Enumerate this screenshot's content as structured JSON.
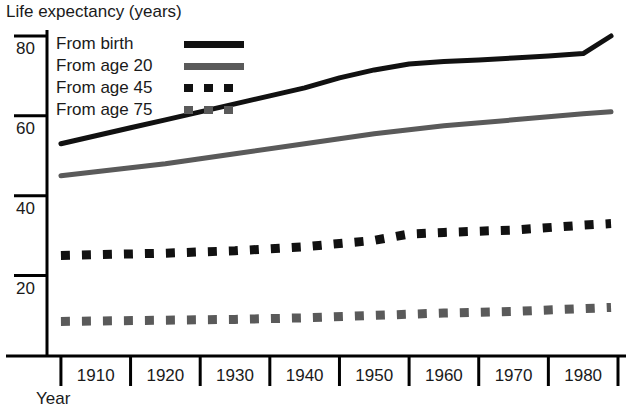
{
  "chart_data": {
    "type": "line",
    "title": "",
    "ylabel": "Life expectancy (years)",
    "xlabel": "Year",
    "xlim": [
      1903,
      1985
    ],
    "ylim": [
      0,
      88
    ],
    "yticks": [
      20,
      40,
      60,
      80
    ],
    "ytick_labels": [
      "20",
      "40",
      "60",
      "80"
    ],
    "xticks": [
      1910,
      1920,
      1930,
      1940,
      1950,
      1960,
      1970,
      1980
    ],
    "xtick_labels": [
      "1910",
      "1920",
      "1930",
      "1940",
      "1950",
      "1960",
      "1970",
      "1980"
    ],
    "grid": false,
    "legend_position": "upper left",
    "series": [
      {
        "name": "From birth",
        "style": "solid",
        "color": "#111111",
        "x": [
          1905,
          1910,
          1915,
          1920,
          1925,
          1930,
          1935,
          1940,
          1945,
          1950,
          1955,
          1960,
          1965,
          1970,
          1975,
          1980,
          1984
        ],
        "values": [
          53.0,
          55.0,
          57.0,
          59.0,
          61.0,
          63.0,
          65.0,
          67.0,
          69.5,
          71.5,
          73.0,
          73.6,
          74.0,
          74.5,
          75.0,
          75.6,
          80.0
        ]
      },
      {
        "name": "From age 20",
        "style": "solid",
        "color": "#5a5a5a",
        "x": [
          1905,
          1910,
          1920,
          1930,
          1940,
          1950,
          1960,
          1970,
          1980,
          1984
        ],
        "values": [
          45.0,
          46.0,
          48.0,
          50.5,
          53.0,
          55.5,
          57.5,
          59.0,
          60.5,
          61.0
        ]
      },
      {
        "name": "From age 45",
        "style": "dashed",
        "color": "#111111",
        "x": [
          1905,
          1910,
          1920,
          1930,
          1940,
          1950,
          1955,
          1960,
          1970,
          1980,
          1984
        ],
        "values": [
          25.0,
          25.2,
          25.6,
          26.2,
          27.2,
          28.8,
          30.4,
          30.8,
          31.4,
          32.6,
          33.0
        ]
      },
      {
        "name": "From age 75",
        "style": "dashed",
        "color": "#5a5a5a",
        "x": [
          1905,
          1910,
          1920,
          1930,
          1940,
          1950,
          1960,
          1970,
          1980,
          1984
        ],
        "values": [
          8.5,
          8.6,
          8.8,
          9.0,
          9.4,
          10.0,
          10.6,
          11.0,
          11.7,
          12.0
        ]
      }
    ]
  },
  "legend": {
    "items": [
      {
        "label": "From birth"
      },
      {
        "label": "From age 20"
      },
      {
        "label": "From age 45"
      },
      {
        "label": "From age 75"
      }
    ]
  },
  "axes": {
    "y_title": "Life expectancy (years)",
    "x_title": "Year"
  },
  "colors": {
    "black": "#111111",
    "gray": "#5a5a5a",
    "axis": "#000000",
    "background": "#ffffff"
  }
}
